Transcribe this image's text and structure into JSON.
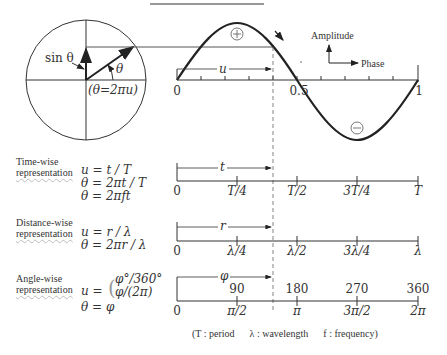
{
  "diagram": {
    "title_line": "",
    "circle": {
      "sin_label": "sin θ",
      "angle_label": "θ",
      "formula": "(θ=2πu)"
    },
    "wave": {
      "positive_sign": "+",
      "negative_sign": "−",
      "u_label": "u",
      "ticks": [
        "0",
        "0.5",
        "1"
      ],
      "legend": {
        "y_axis": "Amplitude",
        "x_axis": "Phase"
      },
      "dash_mark": "-"
    },
    "rows": [
      {
        "id": "time",
        "title_line1": "Time-wise",
        "title_line2": "representation",
        "equations": [
          "u = t / T",
          "θ = 2πt / T",
          "θ = 2πft"
        ],
        "span_label": "t",
        "ticks_below": [
          "0",
          "T/4",
          "T/2",
          "3T/4",
          "T"
        ],
        "ticks_above": []
      },
      {
        "id": "distance",
        "title_line1": "Distance-wise",
        "title_line2": "representation",
        "equations": [
          "u = r / λ",
          "θ = 2πr / λ"
        ],
        "span_label": "r",
        "ticks_below": [
          "0",
          "λ/4",
          "λ/2",
          "3λ/4",
          "λ"
        ],
        "ticks_above": []
      },
      {
        "id": "angle",
        "title_line1": "Angle-wise",
        "title_line2": "representation",
        "equations": [
          "u = ",
          "φ°/360°",
          "φ/(2π)",
          "θ = φ"
        ],
        "span_label": "φ",
        "ticks_below": [
          "0",
          "π/2",
          "π",
          "3π/2",
          "2π"
        ],
        "ticks_above": [
          "90",
          "180",
          "270",
          "360"
        ]
      }
    ],
    "footnote": "(T : period      λ : wavelength      f : frequency)"
  },
  "colors": {
    "ink": "#222222",
    "dash": "#666666",
    "wavy": "#bbbbbb"
  }
}
